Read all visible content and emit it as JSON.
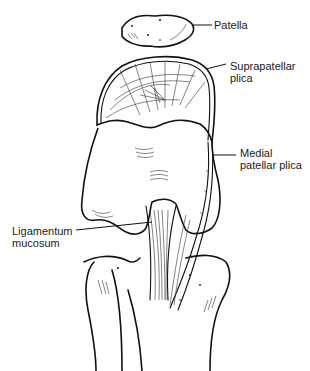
{
  "figure": {
    "labels": {
      "patella": "Patella",
      "suprapatellar_line1": "Suprapatellar",
      "suprapatellar_line2": "plica",
      "medial_line1": "Medial",
      "medial_line2": "patellar plica",
      "ligamentum_line1": "Ligamentum",
      "ligamentum_line2": "mucosum"
    }
  }
}
